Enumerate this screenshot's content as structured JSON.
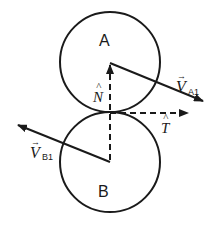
{
  "diagram": {
    "type": "collision-free-body",
    "bodies": [
      {
        "id": "A",
        "label": "A",
        "cx": 110,
        "cy": 62,
        "r": 50
      },
      {
        "id": "B",
        "label": "B",
        "cx": 110,
        "cy": 162,
        "r": 50
      }
    ],
    "vectors": {
      "normal": {
        "symbol": "N",
        "hat": "^",
        "style": "dashed"
      },
      "tangent": {
        "symbol": "T",
        "hat": "^",
        "style": "dashed"
      },
      "va1": {
        "symbol": "V",
        "subscript": "A1",
        "arrow": "→"
      },
      "vb1": {
        "symbol": "V",
        "subscript": "B1",
        "arrow": "→"
      }
    },
    "colors": {
      "stroke": "#1a1a1a",
      "background": "#ffffff"
    }
  }
}
